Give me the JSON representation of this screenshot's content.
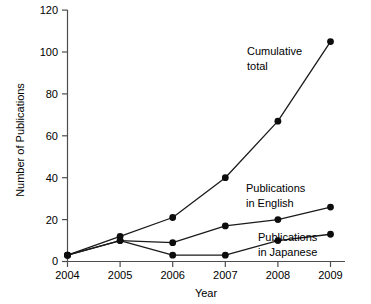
{
  "chart_data": {
    "type": "line",
    "title": "",
    "xlabel": "Year",
    "ylabel": "Number of Publications",
    "categories": [
      "2004",
      "2005",
      "2006",
      "2007",
      "2008",
      "2009"
    ],
    "x": [
      2004,
      2005,
      2006,
      2007,
      2008,
      2009
    ],
    "xlim": [
      2004,
      2009
    ],
    "ylim": [
      0,
      120
    ],
    "yticks": [
      0,
      20,
      40,
      60,
      80,
      100,
      120
    ],
    "xticks": [
      "2004",
      "2005",
      "2006",
      "2007",
      "2008",
      "2009"
    ],
    "grid": false,
    "legend": "inline-annotations",
    "series": [
      {
        "name": "Cumulative total",
        "values": [
          3,
          12,
          21,
          40,
          67,
          105
        ],
        "color": "#1a1a1a",
        "marker": "circle"
      },
      {
        "name": "Publications in English",
        "values": [
          3,
          10,
          9,
          17,
          20,
          26
        ],
        "color": "#1a1a1a",
        "marker": "circle"
      },
      {
        "name": "Publications in Japanese",
        "values": [
          3,
          10,
          3,
          3,
          10,
          13
        ],
        "color": "#1a1a1a",
        "marker": "circle"
      }
    ],
    "annotations": [
      {
        "id": "cumulative",
        "line1": "Cumulative",
        "line2": "total"
      },
      {
        "id": "english",
        "line1": "Publications",
        "line2": "in English"
      },
      {
        "id": "japanese",
        "line1": "Publications",
        "line2": "in Japanese"
      }
    ]
  },
  "ticks": {
    "y": {
      "t0": "0",
      "t1": "20",
      "t2": "40",
      "t3": "60",
      "t4": "80",
      "t5": "100",
      "t6": "120"
    },
    "x": {
      "t0": "2004",
      "t1": "2005",
      "t2": "2006",
      "t3": "2007",
      "t4": "2008",
      "t5": "2009"
    }
  },
  "axes": {
    "x_title": "Year",
    "y_title": "Number of Publications"
  },
  "annotations": {
    "cumulative_l1": "Cumulative",
    "cumulative_l2": "total",
    "english_l1": "Publications",
    "english_l2": "in English",
    "japanese_l1": "Publications",
    "japanese_l2": "in Japanese"
  },
  "colors": {
    "line": "#1a1a1a",
    "marker": "#0d0d0d",
    "spine": "#4d4d4d",
    "background": "#ffffff"
  }
}
